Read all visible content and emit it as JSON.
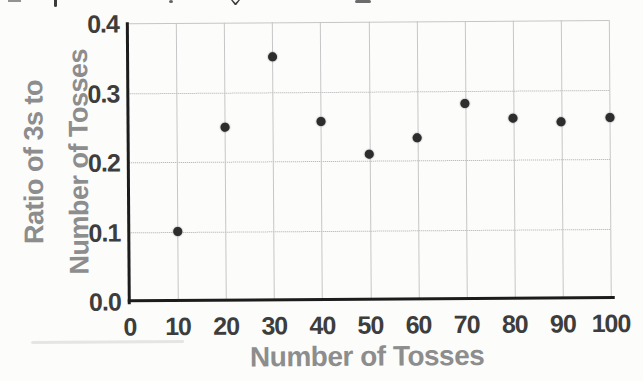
{
  "chart_data": {
    "type": "scatter",
    "title": "",
    "xlabel": "Number of Tosses",
    "ylabel": "Ratio of 3s to Number of Tosses",
    "ylabel_lines": "Ratio of 3s to\nNumber of Tosses",
    "x": [
      10,
      20,
      30,
      40,
      50,
      60,
      70,
      80,
      90,
      100
    ],
    "y": [
      0.1,
      0.25,
      0.35,
      0.257,
      0.21,
      0.233,
      0.281,
      0.26,
      0.254,
      0.26
    ],
    "xlim": [
      0,
      100
    ],
    "ylim": [
      0.0,
      0.4
    ],
    "x_tick_labels": [
      "0",
      "10",
      "20",
      "30",
      "40",
      "50",
      "60",
      "70",
      "80",
      "90",
      "100"
    ],
    "y_tick_labels": [
      "0.0",
      "0.1",
      "0.2",
      "0.3",
      "0.4"
    ],
    "grid": true,
    "legend": "none",
    "colors": {
      "point": "#2d2d2d",
      "axis": "#1c1c1c",
      "grid_dotted": "#ababab",
      "grid_solid": "#c6c6c6",
      "axis_title": "#8d8d8d",
      "tick_label": "#3d3d3d",
      "background": "#fcfcfb"
    }
  }
}
